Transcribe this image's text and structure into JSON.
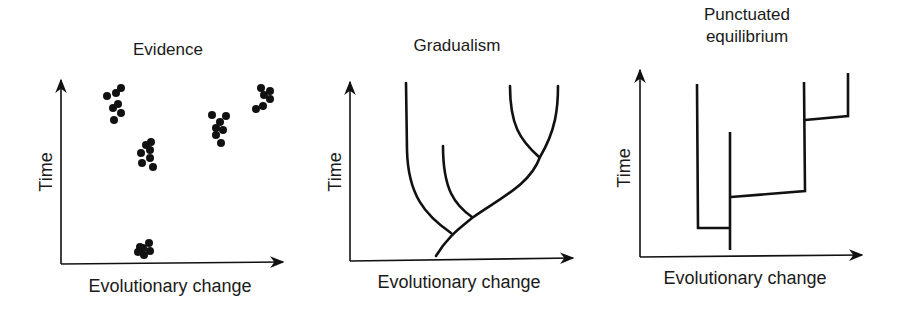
{
  "panels": [
    {
      "title": "Evidence",
      "xlabel": "Evolutionary change",
      "ylabel": "Time",
      "clusters": [
        {
          "cx": 115,
          "cy": 105
        },
        {
          "cx": 147,
          "cy": 154
        },
        {
          "cx": 219,
          "cy": 128
        },
        {
          "cx": 263,
          "cy": 97
        },
        {
          "cx": 145,
          "cy": 249
        }
      ]
    },
    {
      "title": "Gradualism",
      "xlabel": "Evolutionary change",
      "ylabel": "Time"
    },
    {
      "title_lines": [
        "Punctuated",
        "equilibrium"
      ],
      "xlabel": "Evolutionary change",
      "ylabel": "Time"
    }
  ],
  "colors": {
    "ink": "#111111",
    "background": "#ffffff"
  }
}
